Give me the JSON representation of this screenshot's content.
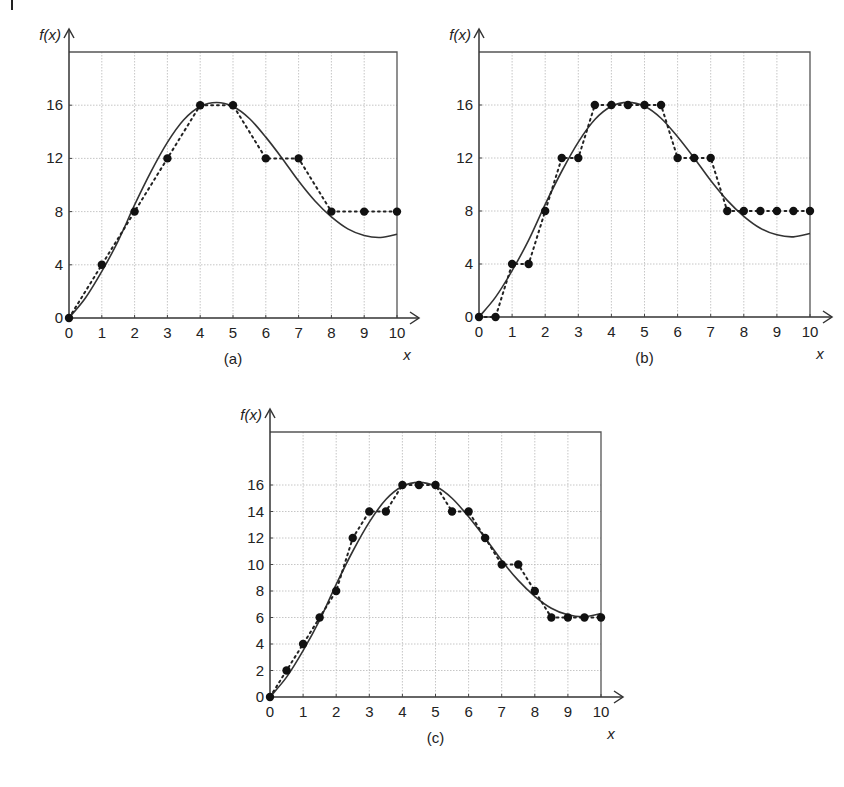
{
  "figure": {
    "corner_mark": "|"
  },
  "chart_data": [
    {
      "type": "line",
      "id": "a",
      "caption": "(a)",
      "xlabel": "x",
      "ylabel": "f(x)",
      "xlim": [
        0,
        10
      ],
      "ylim": [
        0,
        20
      ],
      "xticks": [
        0,
        1,
        2,
        3,
        4,
        5,
        6,
        7,
        8,
        9,
        10
      ],
      "yticks": [
        0,
        4,
        8,
        12,
        16
      ],
      "grid": true,
      "series": [
        {
          "name": "f(x) continuous",
          "style": "solid",
          "x": [
            0,
            0.5,
            1,
            1.5,
            2,
            2.5,
            3,
            3.5,
            4,
            4.5,
            5,
            5.5,
            6,
            6.5,
            7,
            7.5,
            8,
            8.5,
            9,
            9.5,
            10
          ],
          "y": [
            0,
            1.5,
            3.5,
            5.8,
            8.5,
            11,
            13.2,
            14.9,
            15.9,
            16.2,
            15.9,
            15,
            13.6,
            12,
            10.3,
            8.8,
            7.6,
            6.7,
            6.2,
            6.05,
            6.3
          ]
        },
        {
          "name": "quantized samples",
          "style": "dotted-markers",
          "x": [
            0,
            1,
            2,
            3,
            4,
            5,
            6,
            7,
            8,
            9,
            10
          ],
          "y": [
            0,
            4,
            8,
            12,
            16,
            16,
            12,
            12,
            8,
            8,
            8
          ]
        }
      ]
    },
    {
      "type": "line",
      "id": "b",
      "caption": "(b)",
      "xlabel": "x",
      "ylabel": "f(x)",
      "xlim": [
        0,
        10
      ],
      "ylim": [
        0,
        20
      ],
      "xticks": [
        0,
        1,
        2,
        3,
        4,
        5,
        6,
        7,
        8,
        9,
        10
      ],
      "yticks": [
        0,
        4,
        8,
        12,
        16
      ],
      "grid": true,
      "series": [
        {
          "name": "f(x) continuous",
          "style": "solid",
          "x": [
            0,
            0.5,
            1,
            1.5,
            2,
            2.5,
            3,
            3.5,
            4,
            4.5,
            5,
            5.5,
            6,
            6.5,
            7,
            7.5,
            8,
            8.5,
            9,
            9.5,
            10
          ],
          "y": [
            0,
            1.5,
            3.5,
            5.8,
            8.5,
            11,
            13.2,
            14.9,
            15.9,
            16.2,
            15.9,
            15,
            13.6,
            12,
            10.3,
            8.8,
            7.6,
            6.7,
            6.2,
            6.05,
            6.3
          ]
        },
        {
          "name": "quantized samples",
          "style": "dotted-markers",
          "x": [
            0,
            0.5,
            1,
            1.5,
            2,
            2.5,
            3,
            3.5,
            4,
            4.5,
            5,
            5.5,
            6,
            6.5,
            7,
            7.5,
            8,
            8.5,
            9,
            9.5,
            10
          ],
          "y": [
            0,
            0,
            4,
            4,
            8,
            12,
            12,
            16,
            16,
            16,
            16,
            16,
            12,
            12,
            12,
            8,
            8,
            8,
            8,
            8,
            8
          ]
        }
      ]
    },
    {
      "type": "line",
      "id": "c",
      "caption": "(c)",
      "xlabel": "x",
      "ylabel": "f(x)",
      "xlim": [
        0,
        10
      ],
      "ylim": [
        0,
        20
      ],
      "xticks": [
        0,
        1,
        2,
        3,
        4,
        5,
        6,
        7,
        8,
        9,
        10
      ],
      "yticks": [
        0,
        2,
        4,
        6,
        8,
        10,
        12,
        14,
        16
      ],
      "grid": true,
      "series": [
        {
          "name": "f(x) continuous",
          "style": "solid",
          "x": [
            0,
            0.5,
            1,
            1.5,
            2,
            2.5,
            3,
            3.5,
            4,
            4.5,
            5,
            5.5,
            6,
            6.5,
            7,
            7.5,
            8,
            8.5,
            9,
            9.5,
            10
          ],
          "y": [
            0,
            1.5,
            3.5,
            5.8,
            8.5,
            11,
            13.2,
            14.9,
            15.9,
            16.2,
            15.9,
            15,
            13.6,
            12,
            10.3,
            8.8,
            7.6,
            6.7,
            6.2,
            6.05,
            6.3
          ]
        },
        {
          "name": "quantized samples",
          "style": "dotted-markers",
          "x": [
            0,
            0.5,
            1,
            1.5,
            2,
            2.5,
            3,
            3.5,
            4,
            4.5,
            5,
            5.5,
            6,
            6.5,
            7,
            7.5,
            8,
            8.5,
            9,
            9.5,
            10
          ],
          "y": [
            0,
            2,
            4,
            6,
            8,
            12,
            14,
            14,
            16,
            16,
            16,
            14,
            14,
            12,
            10,
            10,
            8,
            6,
            6,
            6,
            6
          ]
        }
      ]
    }
  ]
}
